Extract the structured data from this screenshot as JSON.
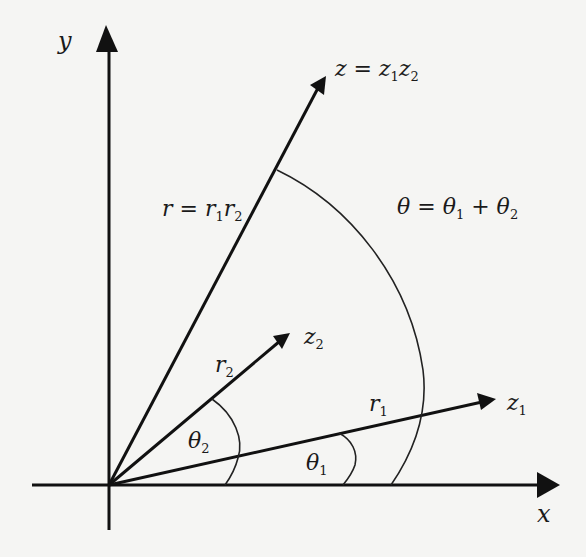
{
  "diagram": {
    "colors": {
      "line": "#111111",
      "background": "#f5f5f3"
    },
    "axes": {
      "x_label": "x",
      "y_label": "y"
    },
    "vectors": [
      {
        "id": "z1",
        "label": "z",
        "sub": "1",
        "length_label": "r",
        "length_sub": "1"
      },
      {
        "id": "z2",
        "label": "z",
        "sub": "2",
        "length_label": "r",
        "length_sub": "2"
      },
      {
        "id": "z",
        "label": "z = z",
        "sub_a": "1",
        "mid": "z",
        "sub_b": "2"
      }
    ],
    "length_product": {
      "lhs": "r = r",
      "sub_a": "1",
      "mid": "r",
      "sub_b": "2"
    },
    "angles": {
      "theta1": {
        "label": "θ",
        "sub": "1"
      },
      "theta2": {
        "label": "θ",
        "sub": "2"
      },
      "theta_sum": {
        "lhs": "θ = θ",
        "sub_a": "1",
        "mid": " + θ",
        "sub_b": "2"
      }
    }
  }
}
